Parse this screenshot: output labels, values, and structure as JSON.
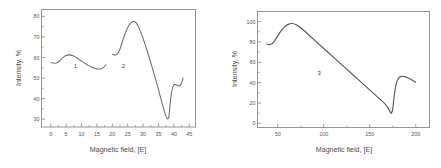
{
  "figure": {
    "background_color": "#ffffff",
    "axis_color": "#8a8a8a",
    "curve_color": "#6e6e6e",
    "text_color": "#555555",
    "panel_count": 2
  },
  "chart_data": [
    {
      "type": "line",
      "panel": "left",
      "title": "",
      "xlabel": "Magnetic field, [E]",
      "ylabel": "Intensity, %",
      "xlim": [
        -3,
        47
      ],
      "ylim": [
        26,
        83
      ],
      "xticks": [
        0,
        5,
        10,
        15,
        20,
        25,
        30,
        35,
        40,
        45
      ],
      "xticklabels": [
        "0",
        "5",
        "10",
        "15",
        "20",
        "25",
        "30",
        "35",
        "40",
        "45"
      ],
      "yticks": [
        30,
        40,
        50,
        60,
        70,
        80
      ],
      "yticklabels": [
        "30",
        "40",
        "50",
        "60",
        "70",
        "80"
      ],
      "grid": false,
      "legend": "none",
      "series": [
        {
          "name": "1",
          "label": "1",
          "label_x": 8.0,
          "label_y": 55.4,
          "x": [
            0.0,
            1.2,
            2.4,
            3.6,
            4.8,
            6.0,
            7.2,
            8.4,
            9.6,
            10.8,
            12.0,
            13.2,
            14.4,
            15.6,
            16.4,
            17.2,
            17.9
          ],
          "y": [
            57.2,
            56.9,
            57.4,
            59.2,
            60.6,
            61.0,
            60.6,
            59.6,
            58.4,
            57.2,
            56.1,
            55.1,
            54.4,
            54.1,
            54.3,
            55.0,
            56.2
          ]
        },
        {
          "name": "2",
          "label": "2",
          "label_x": 23.6,
          "label_y": 55.4,
          "x": [
            20.0,
            20.8,
            21.6,
            22.4,
            23.2,
            24.2,
            25.2,
            26.2,
            27.0,
            27.8,
            28.6,
            29.6,
            30.8,
            32.0,
            33.4,
            34.8,
            36.0,
            37.0,
            37.7,
            38.1,
            38.4,
            38.7,
            39.1,
            39.6,
            40.2,
            41.0,
            41.8,
            42.4,
            43.0
          ],
          "y": [
            61.3,
            60.9,
            61.4,
            63.5,
            67.2,
            71.5,
            74.9,
            76.8,
            77.2,
            76.4,
            74.2,
            70.6,
            65.3,
            59.6,
            52.5,
            45.2,
            38.4,
            33.1,
            30.3,
            30.0,
            31.5,
            36.0,
            41.5,
            45.2,
            46.6,
            46.4,
            45.9,
            47.1,
            49.8
          ]
        }
      ]
    },
    {
      "type": "line",
      "panel": "right",
      "title": "",
      "xlabel": "Magnetic field, [E]",
      "ylabel": "Intensity, %",
      "xlim": [
        28,
        215
      ],
      "ylim": [
        -4,
        110
      ],
      "xticks": [
        50,
        100,
        150,
        200
      ],
      "xticklabels": [
        "50",
        "100",
        "150",
        "200"
      ],
      "yticks": [
        0,
        20,
        40,
        60,
        80,
        100
      ],
      "yticklabels": [
        "0",
        "20",
        "40",
        "60",
        "80",
        "100"
      ],
      "grid": false,
      "legend": "none",
      "series": [
        {
          "name": "3",
          "label": "3",
          "label_x": 95.0,
          "label_y": 50.0,
          "x": [
            38.0,
            41.0,
            44.0,
            47.0,
            50.0,
            54.0,
            58.0,
            62.0,
            66.0,
            70.0,
            75.0,
            82.0,
            92.0,
            104.0,
            118.0,
            132.0,
            146.0,
            158.0,
            166.0,
            170.0,
            172.0,
            173.5,
            175.0,
            176.5,
            178.5,
            181.0,
            184.0,
            188.0,
            192.0,
            196.0,
            200.0
          ],
          "y": [
            78.0,
            77.4,
            78.4,
            81.6,
            86.0,
            91.4,
            95.4,
            97.6,
            98.2,
            97.0,
            94.0,
            88.4,
            80.2,
            70.4,
            59.0,
            47.6,
            36.2,
            26.4,
            19.8,
            15.0,
            11.6,
            10.2,
            14.0,
            26.0,
            38.0,
            44.2,
            46.2,
            46.0,
            44.6,
            42.6,
            40.4
          ]
        }
      ]
    }
  ]
}
